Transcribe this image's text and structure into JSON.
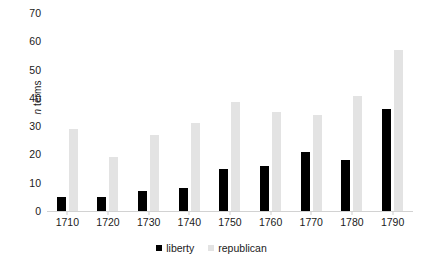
{
  "chart_data": {
    "type": "bar",
    "title": "",
    "xlabel": "",
    "ylabel": "n terms",
    "ylabel_italic_prefix": "n",
    "ylabel_rest": " terms",
    "ylim": [
      0,
      70
    ],
    "ytick_step": 10,
    "yticks": [
      0,
      10,
      20,
      30,
      40,
      50,
      60,
      70
    ],
    "categories": [
      "1710",
      "1720",
      "1730",
      "1740",
      "1750",
      "1760",
      "1770",
      "1780",
      "1790"
    ],
    "grid": false,
    "legend_position": "bottom",
    "series": [
      {
        "name": "liberty",
        "color": "#000000",
        "values": [
          5,
          5,
          7,
          8,
          15,
          16,
          21,
          18,
          36
        ]
      },
      {
        "name": "republican",
        "color": "#e3e3e3",
        "values": [
          29,
          19,
          27,
          31,
          38.5,
          35,
          34,
          40.5,
          57
        ]
      }
    ]
  },
  "legend": {
    "items": [
      {
        "label": "liberty",
        "swatch": "black-square-swatch"
      },
      {
        "label": "republican",
        "swatch": "gray-square-swatch"
      }
    ]
  }
}
